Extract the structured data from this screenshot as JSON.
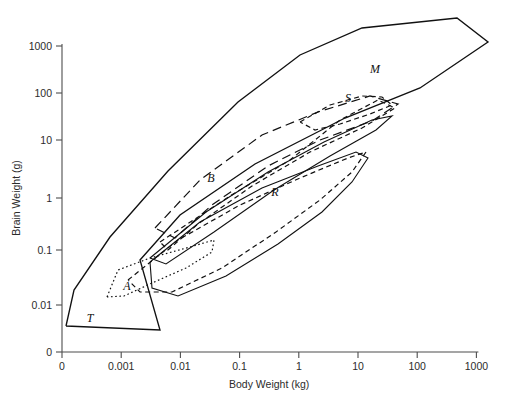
{
  "chart_data": {
    "type": "scatter",
    "title": "",
    "subtitle": "",
    "xlabel": "Body Weight (kg)",
    "ylabel": "Brain Weight (g)",
    "xscale": "log",
    "yscale": "log",
    "grid": false,
    "legend_position": "inline-annotations",
    "xticks": [
      "0",
      "0.001",
      "0.01",
      "0.1",
      "1",
      "10",
      "100",
      "1000"
    ],
    "yticks": [
      "0",
      "0.01",
      "0.1",
      "1",
      "10",
      "100",
      "1000"
    ],
    "xlim": [
      0,
      1000
    ],
    "ylim": [
      0,
      1000
    ],
    "annotations": [
      {
        "label": "M",
        "x": 375,
        "y": 73,
        "meaning": "Mammals convex hull (long-dash)"
      },
      {
        "label": "S",
        "x": 348,
        "y": 102,
        "meaning": "Squamates / secondary group (dash)"
      },
      {
        "label": "B",
        "x": 211,
        "y": 182,
        "meaning": "Birds convex hull (long-dash)"
      },
      {
        "label": "R",
        "x": 275,
        "y": 196,
        "meaning": "Reptiles convex hull (dashed)"
      },
      {
        "label": "A",
        "x": 127,
        "y": 290,
        "meaning": "Amphibians convex hull (dotted)"
      },
      {
        "label": "T",
        "x": 90,
        "y": 322,
        "meaning": "Teleost fish / overall envelope (solid)"
      }
    ],
    "series": [
      {
        "name": "overall-envelope",
        "style": "solid",
        "label": "T",
        "polygon": [
          [
            66,
            326
          ],
          [
            74,
            290
          ],
          [
            110,
            237
          ],
          [
            168,
            171
          ],
          [
            238,
            102
          ],
          [
            300,
            55
          ],
          [
            362,
            28
          ],
          [
            457,
            18
          ],
          [
            488,
            42
          ],
          [
            420,
            88
          ],
          [
            345,
            118
          ],
          [
            255,
            164
          ],
          [
            180,
            215
          ],
          [
            140,
            260
          ],
          [
            160,
            330
          ],
          [
            66,
            326
          ]
        ]
      },
      {
        "name": "birds-hull",
        "style": "long-dash",
        "label": "B",
        "polygon": [
          [
            155,
            228
          ],
          [
            200,
            180
          ],
          [
            262,
            135
          ],
          [
            318,
            112
          ],
          [
            370,
            96
          ],
          [
            398,
            104
          ],
          [
            372,
            121
          ],
          [
            320,
            140
          ],
          [
            268,
            166
          ],
          [
            212,
            205
          ],
          [
            175,
            238
          ],
          [
            155,
            228
          ]
        ]
      },
      {
        "name": "secondary-hull",
        "style": "dash",
        "label": "S",
        "polygon": [
          [
            160,
            242
          ],
          [
            230,
            196
          ],
          [
            290,
            160
          ],
          [
            340,
            120
          ],
          [
            378,
            100
          ],
          [
            395,
            108
          ],
          [
            362,
            128
          ],
          [
            310,
            152
          ],
          [
            252,
            186
          ],
          [
            198,
            224
          ],
          [
            168,
            250
          ],
          [
            160,
            242
          ]
        ]
      },
      {
        "name": "mammals-hull",
        "style": "dash",
        "label": "M",
        "polygon": [
          [
            300,
            122
          ],
          [
            330,
            105
          ],
          [
            362,
            96
          ],
          [
            382,
            97
          ],
          [
            392,
            105
          ],
          [
            370,
            114
          ],
          [
            340,
            124
          ],
          [
            315,
            130
          ],
          [
            300,
            122
          ]
        ]
      },
      {
        "name": "reptiles-hull",
        "style": "dash",
        "label": "R",
        "polygon": [
          [
            128,
            280
          ],
          [
            178,
            240
          ],
          [
            240,
            205
          ],
          [
            300,
            178
          ],
          [
            348,
            158
          ],
          [
            366,
            152
          ],
          [
            352,
            172
          ],
          [
            320,
            200
          ],
          [
            276,
            232
          ],
          [
            222,
            268
          ],
          [
            172,
            292
          ],
          [
            140,
            292
          ],
          [
            128,
            280
          ]
        ]
      },
      {
        "name": "inner-solid-hull",
        "style": "solid-thin",
        "polygon": [
          [
            150,
            262
          ],
          [
            200,
            222
          ],
          [
            262,
            188
          ],
          [
            318,
            166
          ],
          [
            356,
            152
          ],
          [
            368,
            158
          ],
          [
            352,
            182
          ],
          [
            322,
            212
          ],
          [
            278,
            244
          ],
          [
            226,
            276
          ],
          [
            178,
            296
          ],
          [
            152,
            288
          ],
          [
            150,
            262
          ]
        ]
      },
      {
        "name": "amphibians-hull",
        "style": "dotted",
        "label": "A",
        "polygon": [
          [
            107,
            297
          ],
          [
            118,
            270
          ],
          [
            150,
            258
          ],
          [
            190,
            247
          ],
          [
            214,
            240
          ],
          [
            212,
            252
          ],
          [
            186,
            268
          ],
          [
            152,
            283
          ],
          [
            124,
            296
          ],
          [
            107,
            297
          ]
        ]
      },
      {
        "name": "upper-solid-band",
        "style": "solid-thin",
        "polygon": [
          [
            150,
            258
          ],
          [
            206,
            212
          ],
          [
            268,
            172
          ],
          [
            324,
            142
          ],
          [
            372,
            120
          ],
          [
            392,
            116
          ],
          [
            376,
            130
          ],
          [
            330,
            156
          ],
          [
            274,
            190
          ],
          [
            214,
            232
          ],
          [
            166,
            264
          ],
          [
            150,
            258
          ]
        ]
      }
    ]
  },
  "axes": {
    "x_title": "Body Weight (kg)",
    "y_title": "Brain Weight (g)"
  }
}
